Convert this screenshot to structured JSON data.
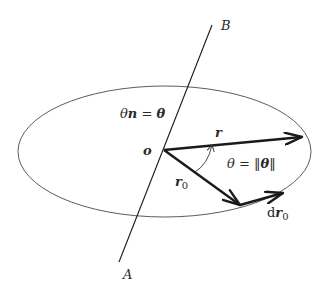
{
  "diagram": {
    "type": "rotation-vector-geometry",
    "colors": {
      "stroke": "#1a1a1a",
      "ellipse": "#4a4a4a",
      "text": "#2a2a2a",
      "background": "#ffffff"
    },
    "axis": {
      "start_label": "A",
      "end_label": "B"
    },
    "axis_label": {
      "theta": "θ",
      "n": "n",
      "equals": " = ",
      "theta_vec": "θ"
    },
    "origin_label": "o",
    "vectors": {
      "r": {
        "label": "r"
      },
      "r0": {
        "label": "r",
        "subscript": "0"
      },
      "dr0": {
        "prefix": "d",
        "label": "r",
        "subscript": "0"
      }
    },
    "angle_label": {
      "theta": "θ",
      "equals": " = ",
      "norm_open": "‖",
      "theta_vec": "θ",
      "norm_close": "‖"
    }
  }
}
